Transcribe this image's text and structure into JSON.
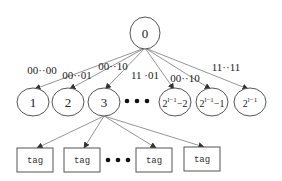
{
  "diagram": {
    "root": {
      "label": "0",
      "cx": 145,
      "cy": 33,
      "rx": 15,
      "ry": 16
    },
    "children": [
      {
        "label": "1",
        "sup": "",
        "suffix": "",
        "cx": 33,
        "cy": 102
      },
      {
        "label": "2",
        "sup": "",
        "suffix": "",
        "cx": 68,
        "cy": 102
      },
      {
        "label": "3",
        "sup": "",
        "suffix": "",
        "cx": 104,
        "cy": 102
      },
      {
        "label": "2",
        "sup": "l−1",
        "suffix": "−2",
        "cx": 175,
        "cy": 102
      },
      {
        "label": "2",
        "sup": "l−1",
        "suffix": "−1",
        "cx": 212,
        "cy": 102
      },
      {
        "label": "2",
        "sup": "l−1",
        "suffix": "",
        "cx": 250,
        "cy": 102
      }
    ],
    "child_radius": {
      "rx": 16,
      "ry": 14
    },
    "ellipsis_children": {
      "dots_x": [
        127,
        137,
        147
      ],
      "y": 101
    },
    "edge_labels": [
      {
        "text": "00··00",
        "x": 42,
        "y": 74
      },
      {
        "text": "00··01",
        "x": 77,
        "y": 79
      },
      {
        "text": "00··10",
        "x": 113,
        "y": 70
      },
      {
        "text": "11 ·01",
        "x": 145,
        "y": 79
      },
      {
        "text": "00··10",
        "x": 185,
        "y": 82
      },
      {
        "text": "11··11",
        "x": 226,
        "y": 71
      }
    ],
    "tags": [
      {
        "label": "tag",
        "x": 17,
        "y": 148,
        "w": 36,
        "h": 24
      },
      {
        "label": "tag",
        "x": 64,
        "y": 148,
        "w": 36,
        "h": 24
      },
      {
        "label": "tag",
        "x": 136,
        "y": 148,
        "w": 36,
        "h": 24
      },
      {
        "label": "tag",
        "x": 184,
        "y": 147,
        "w": 36,
        "h": 24
      }
    ],
    "ellipsis_tags": {
      "dots_x": [
        108,
        118,
        128
      ],
      "y": 160
    },
    "tag_parent_index": 2,
    "colors": {
      "stroke": "#555555",
      "line": "#8a8a8a",
      "arrow": "#333333",
      "text": "#222222"
    }
  }
}
